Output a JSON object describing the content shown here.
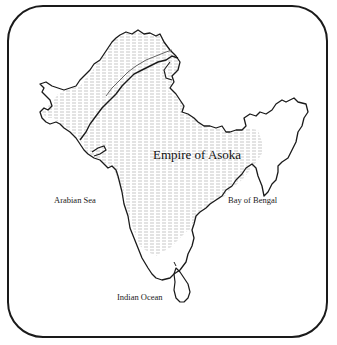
{
  "map": {
    "title": "Empire of Asoka",
    "region_label": "Empire of Asoka",
    "water_labels": {
      "arabian_sea": "Arabian Sea",
      "bay_of_bengal": "Bay of Bengal",
      "indian_ocean": "Indian Ocean"
    },
    "style": {
      "outline_color": "#1a1a1a",
      "hatch_color": "#9a9a9a",
      "background": "#ffffff"
    },
    "legend": {
      "hatched_area": "Empire of Asoka"
    }
  }
}
